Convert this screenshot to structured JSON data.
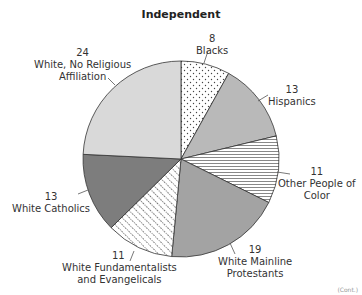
{
  "chart_data": {
    "type": "pie",
    "title": "Independent",
    "start_angle_deg": 0,
    "direction": "clockwise",
    "slices": [
      {
        "label": "Blacks",
        "value": 8,
        "fill": "dots"
      },
      {
        "label": "Hispanics",
        "value": 13,
        "fill": "#b9b9b9"
      },
      {
        "label": "Other People of Color",
        "value": 11,
        "fill": "hlines"
      },
      {
        "label": "White Mainline Protestants",
        "value": 19,
        "fill": "#a3a3a3"
      },
      {
        "label": "White Fundamentalists and Evangelicals",
        "value": 11,
        "fill": "diag-dots"
      },
      {
        "label": "White Catholics",
        "value": 13,
        "fill": "#7d7d7d"
      },
      {
        "label": "White, No Religious Affiliation",
        "value": 24,
        "fill": "#d9d9d9"
      }
    ]
  },
  "labels": {
    "blacks": {
      "value": "8",
      "name": "Blacks"
    },
    "hispanics": {
      "value": "13",
      "name": "Hispanics"
    },
    "other": {
      "value": "11",
      "name1": "Other People of",
      "name2": "Color"
    },
    "mainline": {
      "value": "19",
      "name1": "White Mainline",
      "name2": "Protestants"
    },
    "fundamentalists": {
      "value": "11",
      "name1": "White Fundamentalists",
      "name2": "and Evangelicals"
    },
    "catholics": {
      "value": "13",
      "name": "White Catholics"
    },
    "noreligion": {
      "value": "24",
      "name1": "White, No Religious",
      "name2": "Affiliation"
    }
  },
  "corner_text": "(Cont.)"
}
